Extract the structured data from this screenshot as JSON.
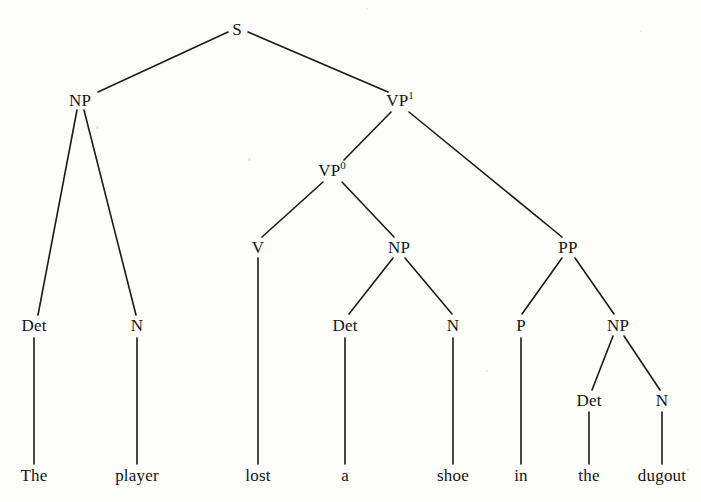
{
  "diagram": {
    "sentence": "The player lost a shoe in the dugout",
    "line_color": "#1a1a1a",
    "background_color": "#fdfdfc",
    "text_color": "#161616",
    "width": 701,
    "height": 502
  },
  "nodes": [
    {
      "id": "S",
      "label": "S",
      "sup": "",
      "x": 237,
      "y": 29
    },
    {
      "id": "NP1",
      "label": "NP",
      "sup": "",
      "x": 80,
      "y": 100
    },
    {
      "id": "VP1",
      "label": "VP",
      "sup": "1",
      "x": 400,
      "y": 100
    },
    {
      "id": "VP0",
      "label": "VP",
      "sup": "0",
      "x": 332,
      "y": 170
    },
    {
      "id": "PP",
      "label": "PP",
      "sup": "",
      "x": 568,
      "y": 247
    },
    {
      "id": "V",
      "label": "V",
      "sup": "",
      "x": 258,
      "y": 247
    },
    {
      "id": "NP2",
      "label": "NP",
      "sup": "",
      "x": 399,
      "y": 247
    },
    {
      "id": "Det1",
      "label": "Det",
      "sup": "",
      "x": 34,
      "y": 325
    },
    {
      "id": "N1",
      "label": "N",
      "sup": "",
      "x": 137,
      "y": 325
    },
    {
      "id": "Det2",
      "label": "Det",
      "sup": "",
      "x": 345,
      "y": 325
    },
    {
      "id": "N2",
      "label": "N",
      "sup": "",
      "x": 453,
      "y": 325
    },
    {
      "id": "P",
      "label": "P",
      "sup": "",
      "x": 521,
      "y": 325
    },
    {
      "id": "NP3",
      "label": "NP",
      "sup": "",
      "x": 618,
      "y": 325
    },
    {
      "id": "Det3",
      "label": "Det",
      "sup": "",
      "x": 589,
      "y": 400
    },
    {
      "id": "N3",
      "label": "N",
      "sup": "",
      "x": 662,
      "y": 400
    }
  ],
  "leaves": [
    {
      "id": "w-the1",
      "label": "The",
      "x": 34,
      "y": 475
    },
    {
      "id": "w-player",
      "label": "player",
      "x": 137,
      "y": 475
    },
    {
      "id": "w-lost",
      "label": "lost",
      "x": 258,
      "y": 475
    },
    {
      "id": "w-a",
      "label": "a",
      "x": 345,
      "y": 475
    },
    {
      "id": "w-shoe",
      "label": "shoe",
      "x": 453,
      "y": 475
    },
    {
      "id": "w-in",
      "label": "in",
      "x": 521,
      "y": 475
    },
    {
      "id": "w-the2",
      "label": "the",
      "x": 589,
      "y": 475
    },
    {
      "id": "w-dugout",
      "label": "dugout",
      "x": 662,
      "y": 475
    }
  ],
  "edges": [
    {
      "id": "e-s-np1",
      "from": "S",
      "to": "NP1",
      "x1": 228,
      "y1": 32,
      "x2": 98,
      "y2": 92
    },
    {
      "id": "e-s-vp1",
      "from": "S",
      "to": "VP1",
      "x1": 248,
      "y1": 32,
      "x2": 388,
      "y2": 92
    },
    {
      "id": "e-np1-det1",
      "from": "NP1",
      "to": "Det1",
      "x1": 77,
      "y1": 110,
      "x2": 38,
      "y2": 315
    },
    {
      "id": "e-np1-n1",
      "from": "NP1",
      "to": "N1",
      "x1": 84,
      "y1": 110,
      "x2": 136,
      "y2": 315
    },
    {
      "id": "e-vp1-vp0",
      "from": "VP1",
      "to": "VP0",
      "x1": 391,
      "y1": 112,
      "x2": 344,
      "y2": 160
    },
    {
      "id": "e-vp1-pp",
      "from": "VP1",
      "to": "PP",
      "x1": 409,
      "y1": 112,
      "x2": 562,
      "y2": 237
    },
    {
      "id": "e-vp0-v",
      "from": "VP0",
      "to": "V",
      "x1": 323,
      "y1": 182,
      "x2": 262,
      "y2": 237
    },
    {
      "id": "e-vp0-np2",
      "from": "VP0",
      "to": "NP2",
      "x1": 342,
      "y1": 182,
      "x2": 394,
      "y2": 237
    },
    {
      "id": "e-np2-det2",
      "from": "NP2",
      "to": "Det2",
      "x1": 393,
      "y1": 258,
      "x2": 349,
      "y2": 314
    },
    {
      "id": "e-np2-n2",
      "from": "NP2",
      "to": "N2",
      "x1": 405,
      "y1": 258,
      "x2": 452,
      "y2": 314
    },
    {
      "id": "e-pp-p",
      "from": "PP",
      "to": "P",
      "x1": 562,
      "y1": 258,
      "x2": 522,
      "y2": 314
    },
    {
      "id": "e-pp-np3",
      "from": "PP",
      "to": "NP3",
      "x1": 575,
      "y1": 258,
      "x2": 614,
      "y2": 314
    },
    {
      "id": "e-np3-det3",
      "from": "NP3",
      "to": "Det3",
      "x1": 613,
      "y1": 336,
      "x2": 592,
      "y2": 390
    },
    {
      "id": "e-np3-n3",
      "from": "NP3",
      "to": "N3",
      "x1": 624,
      "y1": 336,
      "x2": 660,
      "y2": 390
    },
    {
      "id": "e-det1-w",
      "from": "Det1",
      "to": "w-the1",
      "x1": 34,
      "y1": 338,
      "x2": 34,
      "y2": 464
    },
    {
      "id": "e-n1-w",
      "from": "N1",
      "to": "w-player",
      "x1": 137,
      "y1": 338,
      "x2": 137,
      "y2": 464
    },
    {
      "id": "e-v-w",
      "from": "V",
      "to": "w-lost",
      "x1": 258,
      "y1": 258,
      "x2": 258,
      "y2": 464
    },
    {
      "id": "e-det2-w",
      "from": "Det2",
      "to": "w-a",
      "x1": 345,
      "y1": 338,
      "x2": 345,
      "y2": 464
    },
    {
      "id": "e-n2-w",
      "from": "N2",
      "to": "w-shoe",
      "x1": 453,
      "y1": 338,
      "x2": 453,
      "y2": 464
    },
    {
      "id": "e-p-w",
      "from": "P",
      "to": "w-in",
      "x1": 521,
      "y1": 338,
      "x2": 521,
      "y2": 464
    },
    {
      "id": "e-det3-w",
      "from": "Det3",
      "to": "w-the2",
      "x1": 589,
      "y1": 412,
      "x2": 589,
      "y2": 464
    },
    {
      "id": "e-n3-w",
      "from": "N3",
      "to": "w-dugout",
      "x1": 662,
      "y1": 412,
      "x2": 662,
      "y2": 464
    }
  ],
  "specks": [
    {
      "x": 96,
      "y": 126,
      "d": 3
    },
    {
      "x": 248,
      "y": 158,
      "d": 3
    },
    {
      "x": 366,
      "y": 8,
      "d": 2
    },
    {
      "x": 640,
      "y": 30,
      "d": 2
    },
    {
      "x": 486,
      "y": 370,
      "d": 2
    },
    {
      "x": 686,
      "y": 468,
      "d": 3
    }
  ]
}
